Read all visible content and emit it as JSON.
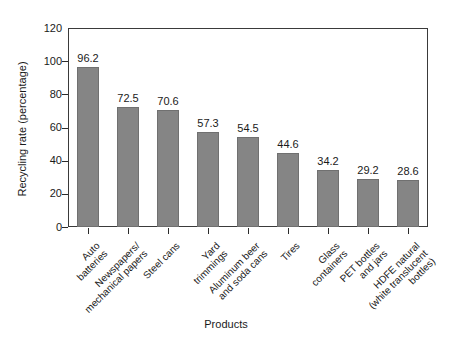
{
  "chart_data": {
    "type": "bar",
    "title": "",
    "subtitle": "",
    "xlabel": "Products",
    "ylabel": "Recycling rate (percentage)",
    "ylim": [
      0,
      120
    ],
    "yticks": [
      0,
      20,
      40,
      60,
      80,
      100,
      120
    ],
    "ytick_labels": [
      "0",
      "20",
      "40",
      "60",
      "80",
      "100",
      "120"
    ],
    "grid": false,
    "legend": false,
    "legend_position": "none",
    "bar_color": "#858585",
    "frame_color": "#3a3a3a",
    "categories": [
      "Auto\nbatteries",
      "Newspapers/\nmechanical papers",
      "Steel cans",
      "Yard\ntrimmings",
      "Aluminum beer\nand soda cans",
      "Tires",
      "Glass\ncontainers",
      "PET bottles\nand jars",
      "HDFE natural\n(white translucent\nbottles)"
    ],
    "values": [
      96.2,
      72.5,
      70.6,
      57.3,
      54.5,
      44.6,
      34.2,
      29.2,
      28.6
    ],
    "value_labels": [
      "96.2",
      "72.5",
      "70.6",
      "57.3",
      "54.5",
      "44.6",
      "34.2",
      "29.2",
      "28.6"
    ]
  }
}
